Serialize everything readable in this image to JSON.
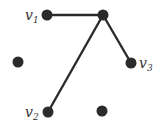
{
  "graph": {
    "nodes": [
      {
        "id": "v1",
        "label": "v",
        "subscript": "1"
      },
      {
        "id": "hub",
        "label": "",
        "subscript": ""
      },
      {
        "id": "left",
        "label": "",
        "subscript": ""
      },
      {
        "id": "v3",
        "label": "v",
        "subscript": "3"
      },
      {
        "id": "v2",
        "label": "v",
        "subscript": "2"
      },
      {
        "id": "bottom",
        "label": "",
        "subscript": ""
      }
    ],
    "edges": [
      {
        "from": "v1",
        "to": "hub"
      },
      {
        "from": "hub",
        "to": "v3"
      },
      {
        "from": "hub",
        "to": "v2"
      }
    ]
  }
}
